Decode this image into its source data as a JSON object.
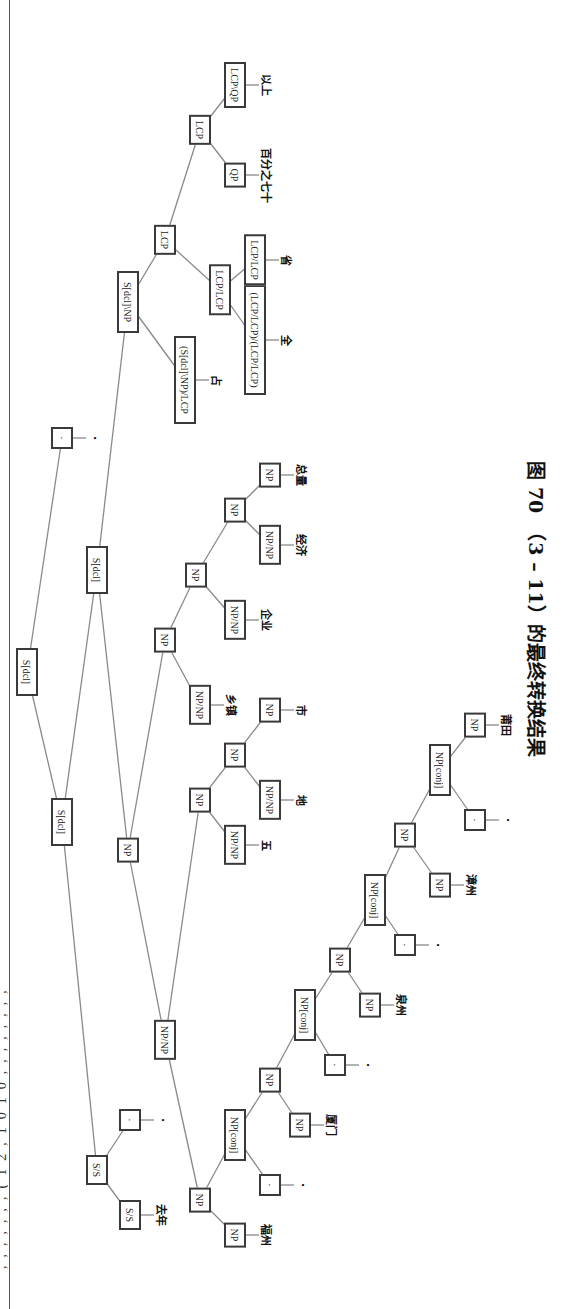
{
  "page": {
    "top_cropped_text": ",,,,,,,(12,1010,,,,,,,,",
    "caption": "图 70　（3 – 11）的最终转换结果"
  },
  "colors": {
    "box_border": "#3a3a3a",
    "edge": "#8a8a8a",
    "text": "#222222"
  },
  "tree": {
    "nodes": [
      {
        "id": "root",
        "label": "S[dcl]",
        "u": 637,
        "v": 27,
        "w": 48
      },
      {
        "id": "sdcl_l",
        "label": "S[dcl]",
        "u": 487,
        "v": 62,
        "w": 48
      },
      {
        "id": "punct_top",
        "label": "·",
        "u": 871,
        "v": 62,
        "w": 22
      },
      {
        "id": "ss",
        "label": "S/S",
        "u": 139,
        "v": 97,
        "w": 30
      },
      {
        "id": "ss_leaf",
        "label": "S/S",
        "u": 94,
        "v": 130,
        "w": 30
      },
      {
        "id": "ss_punct",
        "label": "·",
        "u": 189,
        "v": 130,
        "w": 22
      },
      {
        "id": "sdcl_r",
        "label": "S[dcl]",
        "u": 739,
        "v": 97,
        "w": 48
      },
      {
        "id": "np_main",
        "label": "NP",
        "u": 459,
        "v": 128,
        "w": 22
      },
      {
        "id": "np_np_main",
        "label": "NP/NP",
        "u": 269,
        "v": 165,
        "w": 40
      },
      {
        "id": "np_list",
        "label": "NP",
        "u": 109,
        "v": 200,
        "w": 22
      },
      {
        "id": "np_fuzhou",
        "label": "NP",
        "u": 74,
        "v": 235,
        "w": 22
      },
      {
        "id": "npconj1",
        "label": "NP[conj]",
        "u": 174,
        "v": 235,
        "w": 52
      },
      {
        "id": "punct1",
        "label": "·",
        "u": 124,
        "v": 270,
        "w": 22
      },
      {
        "id": "np_l2",
        "label": "NP",
        "u": 229,
        "v": 270,
        "w": 22
      },
      {
        "id": "np_xiamen",
        "label": "NP",
        "u": 184,
        "v": 300,
        "w": 22
      },
      {
        "id": "npconj2",
        "label": "NP[conj]",
        "u": 294,
        "v": 305,
        "w": 52
      },
      {
        "id": "punct2",
        "label": "·",
        "u": 244,
        "v": 335,
        "w": 22
      },
      {
        "id": "np_l3",
        "label": "NP",
        "u": 349,
        "v": 340,
        "w": 22
      },
      {
        "id": "np_quanzhou",
        "label": "NP",
        "u": 304,
        "v": 370,
        "w": 22
      },
      {
        "id": "npconj3",
        "label": "NP[conj]",
        "u": 409,
        "v": 375,
        "w": 52
      },
      {
        "id": "punct3",
        "label": "·",
        "u": 364,
        "v": 405,
        "w": 22
      },
      {
        "id": "np_l4",
        "label": "NP",
        "u": 474,
        "v": 405,
        "w": 22
      },
      {
        "id": "np_zhangzhou",
        "label": "NP",
        "u": 424,
        "v": 440,
        "w": 22
      },
      {
        "id": "npconj4",
        "label": "NP[conj]",
        "u": 539,
        "v": 440,
        "w": 52
      },
      {
        "id": "punct4",
        "label": "·",
        "u": 489,
        "v": 475,
        "w": 22
      },
      {
        "id": "np_putian",
        "label": "NP",
        "u": 584,
        "v": 475,
        "w": 22
      },
      {
        "id": "np_five",
        "label": "NP",
        "u": 509,
        "v": 200,
        "w": 22
      },
      {
        "id": "npnp_wu",
        "label": "NP/NP",
        "u": 464,
        "v": 235,
        "w": 40
      },
      {
        "id": "np_dishi",
        "label": "NP",
        "u": 554,
        "v": 235,
        "w": 22
      },
      {
        "id": "npnp_di",
        "label": "NP/NP",
        "u": 509,
        "v": 270,
        "w": 40
      },
      {
        "id": "np_shi",
        "label": "NP",
        "u": 599,
        "v": 270,
        "w": 22
      },
      {
        "id": "np_r",
        "label": "NP",
        "u": 669,
        "v": 165,
        "w": 22
      },
      {
        "id": "npnp_xiangzhen",
        "label": "NP/NP",
        "u": 604,
        "v": 200,
        "w": 40
      },
      {
        "id": "np_r2",
        "label": "NP",
        "u": 734,
        "v": 196,
        "w": 22
      },
      {
        "id": "npnp_qiye",
        "label": "NP/NP",
        "u": 689,
        "v": 235,
        "w": 40
      },
      {
        "id": "np_r3",
        "label": "NP",
        "u": 799,
        "v": 235,
        "w": 22
      },
      {
        "id": "npnp_jingji",
        "label": "NP/NP",
        "u": 764,
        "v": 270,
        "w": 40
      },
      {
        "id": "np_zongliang",
        "label": "NP",
        "u": 834,
        "v": 270,
        "w": 22
      },
      {
        "id": "vp",
        "label": "S[dcl]\\NP",
        "u": 1007,
        "v": 128,
        "w": 62
      },
      {
        "id": "vp_zhan",
        "label": "(S[dcl]\\NP)/LCP",
        "u": 929,
        "v": 185,
        "w": 88
      },
      {
        "id": "lcp",
        "label": "LCP",
        "u": 1069,
        "v": 165,
        "w": 28
      },
      {
        "id": "lcp_lcp",
        "label": "LCP/LCP",
        "u": 1019,
        "v": 220,
        "w": 48
      },
      {
        "id": "lcp_quan",
        "label": "(LCP/LCP)/(LCP/LCP)",
        "u": 969,
        "v": 255,
        "w": 110
      },
      {
        "id": "lcp_sheng",
        "label": "LCP/LCP",
        "u": 1049,
        "v": 255,
        "w": 48
      },
      {
        "id": "lcp2",
        "label": "LCP",
        "u": 1179,
        "v": 200,
        "w": 28
      },
      {
        "id": "qp",
        "label": "QP",
        "u": 1134,
        "v": 235,
        "w": 24
      },
      {
        "id": "lcp_qp",
        "label": "LCP\\QP",
        "u": 1224,
        "v": 235,
        "w": 46
      }
    ],
    "edges": [
      [
        "root",
        "sdcl_l"
      ],
      [
        "root",
        "punct_top"
      ],
      [
        "sdcl_l",
        "ss"
      ],
      [
        "sdcl_l",
        "sdcl_r"
      ],
      [
        "ss",
        "ss_leaf"
      ],
      [
        "ss",
        "ss_punct"
      ],
      [
        "sdcl_r",
        "np_main"
      ],
      [
        "sdcl_r",
        "vp"
      ],
      [
        "np_main",
        "np_np_main"
      ],
      [
        "np_main",
        "np_r"
      ],
      [
        "np_np_main",
        "np_list"
      ],
      [
        "np_np_main",
        "np_five"
      ],
      [
        "np_list",
        "np_fuzhou"
      ],
      [
        "np_list",
        "npconj1"
      ],
      [
        "npconj1",
        "punct1"
      ],
      [
        "npconj1",
        "np_l2"
      ],
      [
        "np_l2",
        "np_xiamen"
      ],
      [
        "np_l2",
        "npconj2"
      ],
      [
        "npconj2",
        "punct2"
      ],
      [
        "npconj2",
        "np_l3"
      ],
      [
        "np_l3",
        "np_quanzhou"
      ],
      [
        "np_l3",
        "npconj3"
      ],
      [
        "npconj3",
        "punct3"
      ],
      [
        "npconj3",
        "np_l4"
      ],
      [
        "np_l4",
        "np_zhangzhou"
      ],
      [
        "np_l4",
        "npconj4"
      ],
      [
        "npconj4",
        "punct4"
      ],
      [
        "npconj4",
        "np_putian"
      ],
      [
        "np_five",
        "npnp_wu"
      ],
      [
        "np_five",
        "np_dishi"
      ],
      [
        "np_dishi",
        "npnp_di"
      ],
      [
        "np_dishi",
        "np_shi"
      ],
      [
        "np_r",
        "npnp_xiangzhen"
      ],
      [
        "np_r",
        "np_r2"
      ],
      [
        "np_r2",
        "npnp_qiye"
      ],
      [
        "np_r2",
        "np_r3"
      ],
      [
        "np_r3",
        "npnp_jingji"
      ],
      [
        "np_r3",
        "np_zongliang"
      ],
      [
        "vp",
        "vp_zhan"
      ],
      [
        "vp",
        "lcp"
      ],
      [
        "lcp",
        "lcp_lcp"
      ],
      [
        "lcp",
        "lcp2"
      ],
      [
        "lcp_lcp",
        "lcp_quan"
      ],
      [
        "lcp_lcp",
        "lcp_sheng"
      ],
      [
        "lcp2",
        "qp"
      ],
      [
        "lcp2",
        "lcp_qp"
      ]
    ],
    "words": [
      {
        "node": "punct_top",
        "text": "·"
      },
      {
        "node": "ss_leaf",
        "text": "去年"
      },
      {
        "node": "ss_punct",
        "text": "·"
      },
      {
        "node": "np_fuzhou",
        "text": "福州"
      },
      {
        "node": "punct1",
        "text": "·"
      },
      {
        "node": "np_xiamen",
        "text": "厦门"
      },
      {
        "node": "punct2",
        "text": "·"
      },
      {
        "node": "np_quanzhou",
        "text": "泉州"
      },
      {
        "node": "punct3",
        "text": "·"
      },
      {
        "node": "np_zhangzhou",
        "text": "漳州"
      },
      {
        "node": "punct4",
        "text": "·"
      },
      {
        "node": "np_putian",
        "text": "莆田"
      },
      {
        "node": "npnp_wu",
        "text": "五"
      },
      {
        "node": "npnp_di",
        "text": "地"
      },
      {
        "node": "np_shi",
        "text": "市"
      },
      {
        "node": "npnp_xiangzhen",
        "text": "乡镇"
      },
      {
        "node": "npnp_qiye",
        "text": "企业"
      },
      {
        "node": "npnp_jingji",
        "text": "经济"
      },
      {
        "node": "np_zongliang",
        "text": "总量"
      },
      {
        "node": "vp_zhan",
        "text": "占"
      },
      {
        "node": "lcp_quan",
        "text": "全"
      },
      {
        "node": "lcp_sheng",
        "text": "省"
      },
      {
        "node": "qp",
        "text": "百分之七十"
      },
      {
        "node": "lcp_qp",
        "text": "以上"
      }
    ]
  }
}
